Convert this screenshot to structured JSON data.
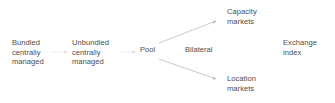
{
  "diagram": {
    "type": "flow-diagram",
    "background_color": "#ffffff",
    "text_color": "#4d4d4d",
    "edge_color": "#b0b0b0",
    "nodes": [
      {
        "id": "bundled",
        "lines": [
          "Bundled",
          "centrally",
          "managed"
        ]
      },
      {
        "id": "unbundled",
        "lines": [
          "Unbundled",
          "centrally",
          "managed"
        ]
      },
      {
        "id": "pool",
        "lines": [
          "Pool"
        ]
      },
      {
        "id": "capacity",
        "lines": [
          "Capacity",
          "markets"
        ]
      },
      {
        "id": "location",
        "lines": [
          "Location",
          "markets"
        ]
      },
      {
        "id": "exchange",
        "lines": [
          "Exchange",
          "index"
        ]
      }
    ],
    "edge_labels": [
      {
        "id": "bilateral",
        "text": "Bilateral"
      }
    ],
    "edges": [
      {
        "from": "bundled",
        "to": "unbundled",
        "style": "arrow"
      },
      {
        "from": "unbundled",
        "to": "pool",
        "style": "arrow"
      },
      {
        "from": "pool",
        "to": "capacity",
        "style": "arrow"
      },
      {
        "from": "pool",
        "to": "location",
        "style": "arrow"
      }
    ]
  }
}
